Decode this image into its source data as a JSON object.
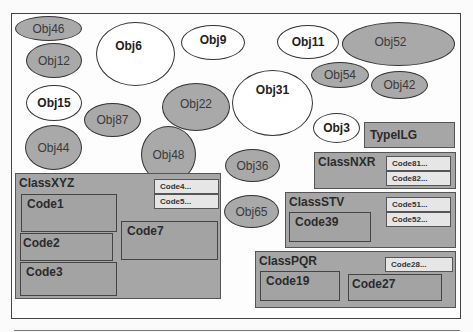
{
  "objects": [
    {
      "id": "obj46",
      "label": "Obj46",
      "style": "gray"
    },
    {
      "id": "obj12",
      "label": "Obj12",
      "style": "gray"
    },
    {
      "id": "obj6",
      "label": "Obj6",
      "style": "white"
    },
    {
      "id": "obj9",
      "label": "Obj9",
      "style": "white"
    },
    {
      "id": "obj11",
      "label": "Obj11",
      "style": "white"
    },
    {
      "id": "obj52",
      "label": "Obj52",
      "style": "gray"
    },
    {
      "id": "obj54",
      "label": "Obj54",
      "style": "gray"
    },
    {
      "id": "obj42",
      "label": "Obj42",
      "style": "gray"
    },
    {
      "id": "obj15",
      "label": "Obj15",
      "style": "white"
    },
    {
      "id": "obj87",
      "label": "Obj87",
      "style": "gray"
    },
    {
      "id": "obj22",
      "label": "Obj22",
      "style": "gray"
    },
    {
      "id": "obj31",
      "label": "Obj31",
      "style": "white"
    },
    {
      "id": "obj3",
      "label": "Obj3",
      "style": "white"
    },
    {
      "id": "obj44",
      "label": "Obj44",
      "style": "gray"
    },
    {
      "id": "obj48",
      "label": "Obj48",
      "style": "gray"
    },
    {
      "id": "obj36",
      "label": "Obj36",
      "style": "gray"
    },
    {
      "id": "obj65",
      "label": "Obj65",
      "style": "gray"
    }
  ],
  "type_box": {
    "label": "TypeILG"
  },
  "classes": {
    "xyz": {
      "title": "ClassXYZ",
      "stubs": [
        "Code4...",
        "Code5..."
      ],
      "codes": [
        "Code1",
        "Code2",
        "Code3",
        "Code7"
      ]
    },
    "nxr": {
      "title": "ClassNXR",
      "stubs": [
        "Code81...",
        "Code82..."
      ]
    },
    "stv": {
      "title": "ClassSTV",
      "stubs": [
        "Code51...",
        "Code52..."
      ],
      "codes": [
        "Code39"
      ]
    },
    "pqr": {
      "title": "ClassPQR",
      "stubs": [
        "Code28..."
      ],
      "codes": [
        "Code19",
        "Code27"
      ]
    }
  },
  "colors": {
    "gray_fill": "#a9a9a9",
    "white_fill": "#ffffff",
    "stub_fill": "#e6e6e6",
    "border": "#333333"
  }
}
